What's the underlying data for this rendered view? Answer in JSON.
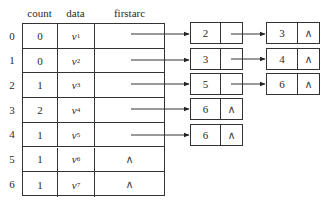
{
  "headers": {
    "count": "count",
    "data": "data",
    "firstarc": "firstarc"
  },
  "null_symbol": "∧",
  "rows": [
    {
      "index": "0",
      "count": "0",
      "data_var": "v",
      "data_sub": "1",
      "firstarc": "arrow"
    },
    {
      "index": "1",
      "count": "0",
      "data_var": "v",
      "data_sub": "2",
      "firstarc": "arrow"
    },
    {
      "index": "2",
      "count": "1",
      "data_var": "v",
      "data_sub": "3",
      "firstarc": "arrow"
    },
    {
      "index": "3",
      "count": "2",
      "data_var": "v",
      "data_sub": "4",
      "firstarc": "arrow"
    },
    {
      "index": "4",
      "count": "1",
      "data_var": "v",
      "data_sub": "5",
      "firstarc": "arrow"
    },
    {
      "index": "5",
      "count": "1",
      "data_var": "v",
      "data_sub": "6",
      "firstarc": "∧"
    },
    {
      "index": "6",
      "count": "1",
      "data_var": "v",
      "data_sub": "7",
      "firstarc": "∧"
    }
  ],
  "edge_lists": [
    {
      "row": 0,
      "nodes": [
        {
          "adjvex": "2",
          "next": "arrow"
        },
        {
          "adjvex": "3",
          "next": "∧"
        }
      ]
    },
    {
      "row": 1,
      "nodes": [
        {
          "adjvex": "3",
          "next": "arrow"
        },
        {
          "adjvex": "4",
          "next": "∧"
        }
      ]
    },
    {
      "row": 2,
      "nodes": [
        {
          "adjvex": "5",
          "next": "arrow"
        },
        {
          "adjvex": "6",
          "next": "∧"
        }
      ]
    },
    {
      "row": 3,
      "nodes": [
        {
          "adjvex": "6",
          "next": "∧"
        }
      ]
    },
    {
      "row": 4,
      "nodes": [
        {
          "adjvex": "6",
          "next": "∧"
        }
      ]
    }
  ]
}
